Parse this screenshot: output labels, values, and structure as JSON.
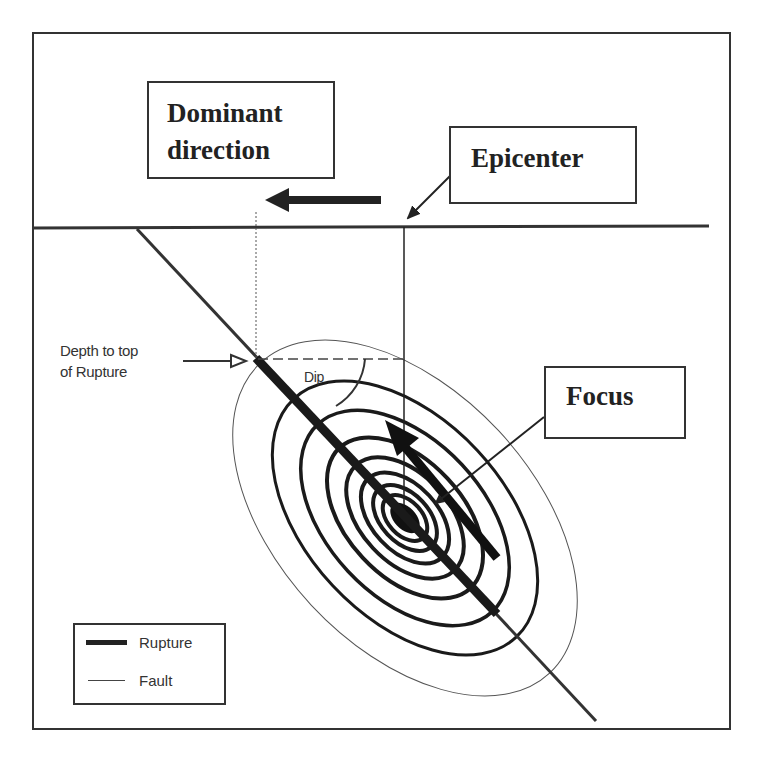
{
  "labels": {
    "dominant_line1": "Dominant",
    "dominant_line2": "direction",
    "epicenter": "Epicenter",
    "focus": "Focus",
    "depth_line1": "Depth to top",
    "depth_line2": "of Rupture",
    "dip": "Dip"
  },
  "legend": {
    "items": [
      {
        "label": "Rupture",
        "style": "thick-line"
      },
      {
        "label": "Fault",
        "style": "thin-line"
      }
    ]
  },
  "colors": {
    "ink": "#222222",
    "frame": "#333333",
    "background": "#ffffff"
  },
  "geometry": {
    "focus_center": [
      405,
      518
    ],
    "fault_angle_deg": 47,
    "ring_count": 7
  }
}
